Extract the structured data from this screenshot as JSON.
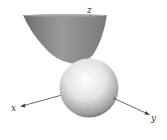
{
  "figure": {
    "axes": {
      "x_label": "x",
      "y_label": "y",
      "z_label": "z"
    },
    "surfaces": [
      {
        "name": "paraboloid",
        "shade": "#8a8a8a"
      },
      {
        "name": "sphere",
        "shade": "#e8e8e8"
      }
    ]
  }
}
